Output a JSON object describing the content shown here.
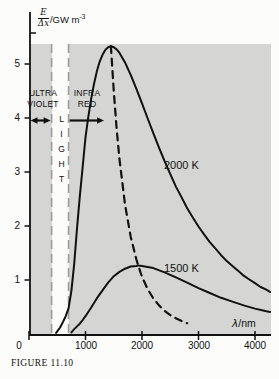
{
  "figure": {
    "caption": "FIGURE 11.10"
  },
  "axes": {
    "y_frac_num": "E",
    "y_frac_den": "Δx",
    "y_unit_base": "/GW m",
    "y_unit_exp": "-3",
    "x_label_sym": "λ",
    "x_label_rest": "/nm",
    "y_ticks": [
      "5",
      "4",
      "3",
      "2",
      "1"
    ],
    "x_ticks": [
      "0",
      "1000",
      "2000",
      "3000",
      "4000"
    ]
  },
  "regions": {
    "ultraviolet": {
      "line1": "ULTRA",
      "line2": "VIOLET"
    },
    "light": {
      "label": "LIGHT"
    },
    "infrared": {
      "line1": "INFRA",
      "line2": "RED"
    }
  },
  "colors": {
    "page_background": "#fcfcfa",
    "plot_background": "#d5d5d3",
    "curve": "#111111",
    "band_line": "#9b9b99"
  },
  "chart_data": {
    "type": "line",
    "xlabel": "λ/nm",
    "ylabel": "E/Δx /GW m⁻³",
    "xlim": [
      0,
      4265
    ],
    "ylim": [
      0,
      5.35
    ],
    "x_tick_values": [
      0,
      1000,
      2000,
      3000,
      4000
    ],
    "y_tick_values": [
      1,
      2,
      3,
      4,
      5
    ],
    "grid": false,
    "bands": {
      "visible_light_nm": [
        400,
        700
      ]
    },
    "series": [
      {
        "name": "2000 K",
        "style": "solid",
        "points": [
          [
            480,
            0.02
          ],
          [
            550,
            0.12
          ],
          [
            600,
            0.22
          ],
          [
            650,
            0.33
          ],
          [
            700,
            0.48
          ],
          [
            750,
            0.8
          ],
          [
            800,
            1.3
          ],
          [
            850,
            1.95
          ],
          [
            900,
            2.55
          ],
          [
            950,
            3.1
          ],
          [
            1000,
            3.64
          ],
          [
            1050,
            4.02
          ],
          [
            1100,
            4.36
          ],
          [
            1150,
            4.63
          ],
          [
            1200,
            4.86
          ],
          [
            1250,
            5.04
          ],
          [
            1300,
            5.17
          ],
          [
            1350,
            5.26
          ],
          [
            1400,
            5.31
          ],
          [
            1449,
            5.33
          ],
          [
            1500,
            5.31
          ],
          [
            1550,
            5.27
          ],
          [
            1600,
            5.21
          ],
          [
            1700,
            5.03
          ],
          [
            1800,
            4.8
          ],
          [
            1900,
            4.54
          ],
          [
            2000,
            4.27
          ],
          [
            2100,
            3.99
          ],
          [
            2200,
            3.72
          ],
          [
            2300,
            3.45
          ],
          [
            2400,
            3.2
          ],
          [
            2500,
            2.96
          ],
          [
            2600,
            2.73
          ],
          [
            2700,
            2.53
          ],
          [
            2800,
            2.33
          ],
          [
            2900,
            2.16
          ],
          [
            3000,
            1.99
          ],
          [
            3100,
            1.84
          ],
          [
            3200,
            1.7
          ],
          [
            3300,
            1.58
          ],
          [
            3400,
            1.46
          ],
          [
            3500,
            1.35
          ],
          [
            3600,
            1.26
          ],
          [
            3700,
            1.17
          ],
          [
            3800,
            1.08
          ],
          [
            3900,
            1.01
          ],
          [
            4000,
            0.94
          ],
          [
            4100,
            0.87
          ],
          [
            4200,
            0.82
          ],
          [
            4265,
            0.78
          ]
        ]
      },
      {
        "name": "1500 K",
        "style": "solid",
        "points": [
          [
            750,
            0.03
          ],
          [
            800,
            0.09
          ],
          [
            850,
            0.14
          ],
          [
            900,
            0.19
          ],
          [
            950,
            0.26
          ],
          [
            1000,
            0.33
          ],
          [
            1100,
            0.49
          ],
          [
            1200,
            0.66
          ],
          [
            1300,
            0.81
          ],
          [
            1400,
            0.95
          ],
          [
            1500,
            1.07
          ],
          [
            1600,
            1.15
          ],
          [
            1700,
            1.21
          ],
          [
            1800,
            1.25
          ],
          [
            1900,
            1.26
          ],
          [
            1932,
            1.27
          ],
          [
            2000,
            1.26
          ],
          [
            2100,
            1.24
          ],
          [
            2200,
            1.22
          ],
          [
            2400,
            1.14
          ],
          [
            2600,
            1.05
          ],
          [
            2800,
            0.95
          ],
          [
            3000,
            0.85
          ],
          [
            3200,
            0.76
          ],
          [
            3400,
            0.67
          ],
          [
            3600,
            0.6
          ],
          [
            3800,
            0.53
          ],
          [
            4000,
            0.47
          ],
          [
            4200,
            0.42
          ],
          [
            4265,
            0.41
          ]
        ]
      },
      {
        "name": "locus of maxima",
        "style": "dashed",
        "points": [
          [
            1449,
            5.33
          ],
          [
            1500,
            4.49
          ],
          [
            1550,
            3.81
          ],
          [
            1600,
            3.25
          ],
          [
            1700,
            2.4
          ],
          [
            1800,
            1.8
          ],
          [
            1900,
            1.38
          ],
          [
            1932,
            1.27
          ],
          [
            2000,
            1.06
          ],
          [
            2100,
            0.83
          ],
          [
            2200,
            0.66
          ],
          [
            2300,
            0.53
          ],
          [
            2400,
            0.43
          ],
          [
            2500,
            0.35
          ],
          [
            2600,
            0.29
          ],
          [
            2700,
            0.24
          ],
          [
            2800,
            0.2
          ]
        ]
      }
    ]
  }
}
